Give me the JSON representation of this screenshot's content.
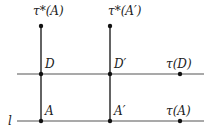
{
  "diagram": {
    "colors": {
      "line": "#555555",
      "vertical": "#222222",
      "dot": "#111111",
      "text": "#222222",
      "background": "#ffffff"
    },
    "lines": {
      "l": {
        "label": "l",
        "y": 121,
        "x1": 17,
        "x2": 204
      },
      "D_line": {
        "y": 74,
        "x1": 17,
        "x2": 204
      }
    },
    "verticals": [
      {
        "x": 41,
        "y1": 26,
        "y2": 121
      },
      {
        "x": 110,
        "y1": 26,
        "y2": 121
      }
    ],
    "points": [
      {
        "id": "tau_star_A",
        "label": "τ*(A)",
        "x": 41,
        "y": 26,
        "lx": 33,
        "ly": 15
      },
      {
        "id": "tau_star_A_prime",
        "label": "τ*(A′)",
        "x": 110,
        "y": 26,
        "lx": 108,
        "ly": 15
      },
      {
        "id": "D",
        "label": "D",
        "x": 41,
        "y": 74,
        "lx": 45,
        "ly": 68
      },
      {
        "id": "D_prime",
        "label": "D′",
        "x": 110,
        "y": 74,
        "lx": 114,
        "ly": 68
      },
      {
        "id": "tau_D",
        "label": "τ(D)",
        "x": 180,
        "y": 74,
        "lx": 166,
        "ly": 68
      },
      {
        "id": "A",
        "label": "A",
        "x": 41,
        "y": 121,
        "lx": 45,
        "ly": 115
      },
      {
        "id": "A_prime",
        "label": "A′",
        "x": 110,
        "y": 121,
        "lx": 114,
        "ly": 115
      },
      {
        "id": "tau_A",
        "label": "τ(A)",
        "x": 180,
        "y": 121,
        "lx": 166,
        "ly": 115
      }
    ]
  }
}
